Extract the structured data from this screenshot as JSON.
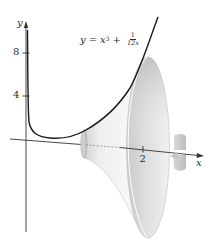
{
  "figure": {
    "equation": {
      "lhs": "y",
      "equals": "=",
      "term1_base": "x",
      "term1_exp": "3",
      "plus": "+",
      "frac_num": "1",
      "frac_den": "12x"
    },
    "axes": {
      "x_label": "x",
      "y_label": "y",
      "x_ticks": [
        {
          "value": "2"
        }
      ],
      "y_ticks": [
        {
          "value": "8"
        },
        {
          "value": "4"
        }
      ]
    },
    "colors": {
      "curve": "#1a1a1a",
      "axis": "#333333",
      "surface_light": "#f4f4f4",
      "surface_dark": "#b8b8b8",
      "rotation_arrow": "#c8c8c8"
    }
  }
}
